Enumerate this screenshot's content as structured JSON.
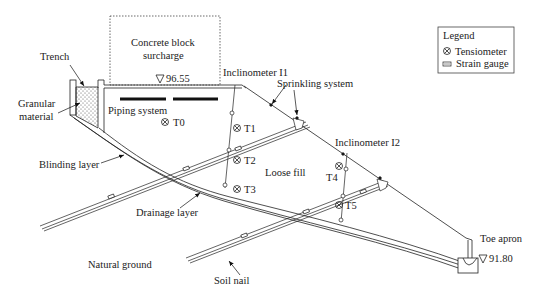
{
  "diagram": {
    "labels": {
      "trench": "Trench",
      "granular_material_line1": "Granular",
      "granular_material_line2": "material",
      "concrete_block_line1": "Concrete block",
      "concrete_block_line2": "surcharge",
      "elevation_top": "96.55",
      "piping_system": "Piping system",
      "inclinometer_i1": "Inclinometer I1",
      "sprinkling_system": "Sprinkling  system",
      "inclinometer_i2": "Inclinometer I2",
      "blinding_layer": "Blinding layer",
      "loose_fill": "Loose fill",
      "drainage_layer": "Drainage layer",
      "natural_ground": "Natural ground",
      "soil_nail": "Soil nail",
      "toe_apron": "Toe apron",
      "elevation_toe": "91.80"
    },
    "tensiometers": [
      {
        "id": "T0",
        "x": 190,
        "y": 124
      },
      {
        "id": "T1",
        "x": 236,
        "y": 128
      },
      {
        "id": "T2",
        "x": 236,
        "y": 160
      },
      {
        "id": "T3",
        "x": 236,
        "y": 189
      },
      {
        "id": "T4",
        "x": 338,
        "y": 167
      },
      {
        "id": "T5",
        "x": 339,
        "y": 205
      }
    ],
    "legend": {
      "title": "Legend",
      "items": [
        {
          "symbol": "tensiometer",
          "label": "Tensiometer"
        },
        {
          "symbol": "strain-gauge",
          "label": "Strain gauge"
        }
      ]
    }
  }
}
